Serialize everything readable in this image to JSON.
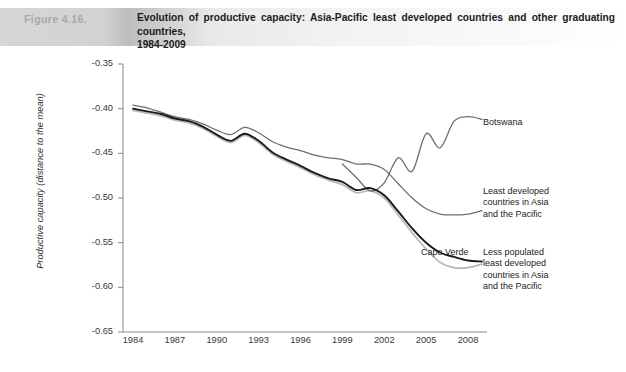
{
  "header": {
    "figure_label": "Figure 4.16.",
    "title_line1": "Evolution of productive capacity: Asia-Pacific least developed countries and other graduating countries,",
    "title_line2": "1984-2009"
  },
  "annotations": {
    "botswana": "Botswana",
    "ldc_asia_pacific": "Least developed\ncountries in Asia\nand the Pacific",
    "cape_verde": "Cape Verde",
    "less_populated": "Less populated\nleast developed\ncountries in Asia\nand the Pacific"
  },
  "colors": {
    "cape_verde": "#1a1a1a",
    "less_populated": "#b8b8b8",
    "ldc_asia_pacific": "#6e6e6e",
    "botswana": "#6e6e6e",
    "axis": "#8a8a8a",
    "header_band": "#bdbdbd",
    "figure_label": "#a8a8a8"
  },
  "chart_data": {
    "type": "line",
    "title": "Evolution of productive capacity: Asia-Pacific least developed countries and other graduating countries, 1984-2009",
    "xlabel": "",
    "ylabel": "Productive capacity (distance to the mean)",
    "xlim": [
      1984,
      2009
    ],
    "ylim": [
      -0.65,
      -0.35
    ],
    "yticks": [
      -0.65,
      -0.6,
      -0.55,
      -0.5,
      -0.45,
      -0.4,
      -0.35
    ],
    "ytick_labels": [
      "-0.65",
      "-0.60",
      "-0.55",
      "-0.50",
      "-0.45",
      "-0.40",
      "-0.35"
    ],
    "xticks": [
      1984,
      1987,
      1990,
      1993,
      1996,
      1999,
      2002,
      2005,
      2008
    ],
    "xtick_labels": [
      "1984",
      "1987",
      "1990",
      "1993",
      "1996",
      "1999",
      "2002",
      "2005",
      "2008"
    ],
    "grid": false,
    "legend": "annotations-at-line-ends",
    "series": [
      {
        "name": "Least developed countries in Asia and the Pacific",
        "color": "#6e6e6e",
        "x": [
          1984,
          1985,
          1986,
          1987,
          1988,
          1989,
          1990,
          1991,
          1992,
          1993,
          1994,
          1995,
          1996,
          1997,
          1998,
          1999,
          2000,
          2001,
          2002,
          2003,
          2004,
          2005,
          2006,
          2007,
          2008,
          2009
        ],
        "y": [
          -0.396,
          -0.399,
          -0.404,
          -0.409,
          -0.412,
          -0.417,
          -0.424,
          -0.429,
          -0.421,
          -0.427,
          -0.437,
          -0.443,
          -0.447,
          -0.452,
          -0.455,
          -0.457,
          -0.462,
          -0.462,
          -0.468,
          -0.484,
          -0.5,
          -0.512,
          -0.518,
          -0.519,
          -0.518,
          -0.514
        ]
      },
      {
        "name": "Cape Verde",
        "color": "#1a1a1a",
        "x": [
          1984,
          1985,
          1986,
          1987,
          1988,
          1989,
          1990,
          1991,
          1992,
          1993,
          1994,
          1995,
          1996,
          1997,
          1998,
          1999,
          2000,
          2001,
          2002,
          2003,
          2004,
          2005,
          2006,
          2007,
          2008,
          2009
        ],
        "y": [
          -0.4,
          -0.403,
          -0.406,
          -0.411,
          -0.414,
          -0.42,
          -0.429,
          -0.436,
          -0.428,
          -0.436,
          -0.449,
          -0.457,
          -0.464,
          -0.472,
          -0.478,
          -0.482,
          -0.491,
          -0.489,
          -0.497,
          -0.515,
          -0.534,
          -0.55,
          -0.561,
          -0.566,
          -0.57,
          -0.571
        ]
      },
      {
        "name": "Less populated least developed countries in Asia and the Pacific",
        "color": "#b8b8b8",
        "x": [
          1984,
          1985,
          1986,
          1987,
          1988,
          1989,
          1990,
          1991,
          1992,
          1993,
          1994,
          1995,
          1996,
          1997,
          1998,
          1999,
          2000,
          2001,
          2002,
          2003,
          2004,
          2005,
          2006,
          2007,
          2008,
          2009
        ],
        "y": [
          -0.402,
          -0.405,
          -0.408,
          -0.413,
          -0.416,
          -0.422,
          -0.431,
          -0.438,
          -0.43,
          -0.438,
          -0.451,
          -0.459,
          -0.466,
          -0.474,
          -0.48,
          -0.485,
          -0.494,
          -0.492,
          -0.5,
          -0.519,
          -0.539,
          -0.557,
          -0.572,
          -0.578,
          -0.578,
          -0.574
        ]
      },
      {
        "name": "Botswana",
        "color": "#6e6e6e",
        "x": [
          1999,
          2000,
          2001,
          2002,
          2003,
          2004,
          2005,
          2006,
          2007,
          2008,
          2009
        ],
        "y": [
          -0.462,
          -0.477,
          -0.492,
          -0.483,
          -0.455,
          -0.47,
          -0.428,
          -0.444,
          -0.414,
          -0.409,
          -0.412
        ]
      }
    ]
  }
}
